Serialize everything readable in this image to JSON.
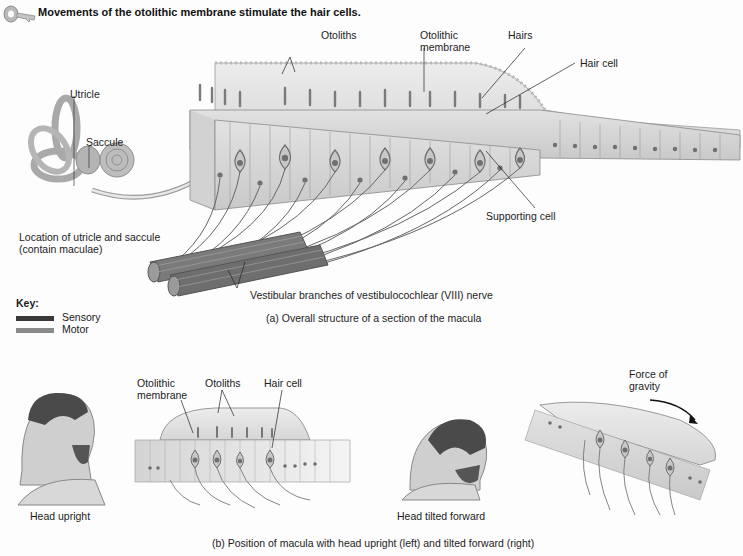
{
  "header": {
    "icon": "key-icon",
    "title": "Movements of the otolithic membrane stimulate the hair cells."
  },
  "panel_a": {
    "inner_ear_labels": {
      "utricle": "Utricle",
      "saccule": "Saccule",
      "location_line1": "Location of utricle and saccule",
      "location_line2": "(contain maculae)"
    },
    "structure_labels": {
      "otoliths": "Otoliths",
      "otolithic_membrane_line1": "Otolithic",
      "otolithic_membrane_line2": "membrane",
      "hairs": "Hairs",
      "hair_cell": "Hair cell",
      "supporting_cell": "Supporting cell",
      "nerve": "Vestibular branches of vestibulocochlear (VIII) nerve"
    },
    "caption": "(a) Overall structure of a section of the macula"
  },
  "key": {
    "title": "Key:",
    "items": [
      {
        "label": "Sensory",
        "color": "#3a3a3a"
      },
      {
        "label": "Motor",
        "color": "#8a8a8a"
      }
    ]
  },
  "panel_b": {
    "upright": {
      "head_label": "Head upright",
      "otolithic_membrane_line1": "Otolithic",
      "otolithic_membrane_line2": "membrane",
      "otoliths": "Otoliths",
      "hair_cell": "Hair cell"
    },
    "tilted": {
      "head_label": "Head tilted forward",
      "gravity_line1": "Force of",
      "gravity_line2": "gravity"
    },
    "caption": "(b) Position of macula with head upright (left) and tilted forward (right)"
  },
  "colors": {
    "tissue": "#d8d8d8",
    "membrane": "#e6e6e6",
    "cell_outline": "#7a7a7a",
    "nucleus": "#6a6a6a",
    "nerve": "#5a5a5a"
  }
}
